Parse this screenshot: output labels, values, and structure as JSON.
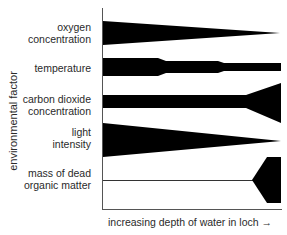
{
  "diagram": {
    "y_axis_label": "environmental factor",
    "x_axis_label": "increasing depth of water in loch",
    "x_axis_arrow": "→",
    "rows": [
      {
        "label_line1": "oxygen",
        "label_line2": "concentration",
        "trend": "decreases with depth"
      },
      {
        "label_line1": "temperature",
        "label_line2": "",
        "trend": "decreases in steps with depth"
      },
      {
        "label_line1": "carbon dioxide",
        "label_line2": "concentration",
        "trend": "constant then increases at depth"
      },
      {
        "label_line1": "light",
        "label_line2": "intensity",
        "trend": "decreases with depth"
      },
      {
        "label_line1": "mass of dead",
        "label_line2": "organic matter",
        "trend": "near zero then increases sharply at bottom"
      }
    ],
    "colors": {
      "shape": "#000000",
      "axis": "#555555",
      "text": "#2a2a2a",
      "background": "#ffffff"
    }
  }
}
